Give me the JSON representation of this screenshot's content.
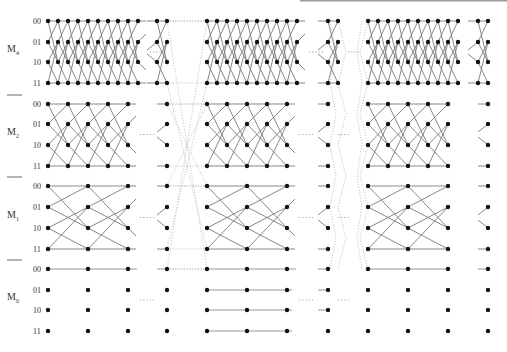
{
  "figure": {
    "type": "trellis-diagram",
    "modes": [
      {
        "name": "M",
        "sub": "4",
        "rows": [
          "00",
          "01",
          "10",
          "11"
        ],
        "y": [
          21,
          42,
          62,
          83
        ],
        "label_y": 52
      },
      {
        "name": "M",
        "sub": "2",
        "rows": [
          "00",
          "01",
          "10",
          "11"
        ],
        "y": [
          104,
          124,
          145,
          166
        ],
        "label_y": 135
      },
      {
        "name": "M",
        "sub": "1",
        "rows": [
          "00",
          "01",
          "10",
          "11"
        ],
        "y": [
          186,
          207,
          228,
          249
        ],
        "label_y": 218
      },
      {
        "name": "M",
        "sub": "0",
        "rows": [
          "00",
          "01",
          "10",
          "11"
        ],
        "y": [
          269,
          290,
          310,
          331
        ],
        "label_y": 300
      }
    ],
    "separators_y": [
      95,
      177,
      260
    ],
    "ellipsis": "···",
    "columns": {
      "M4": [
        [
          48,
          58,
          68,
          78,
          88,
          98,
          108,
          118,
          128,
          138
        ],
        [
          157,
          167
        ],
        [
          207,
          217,
          227,
          237,
          247,
          257,
          267,
          277,
          287,
          297
        ],
        [
          328,
          338
        ],
        [
          368,
          378,
          388,
          398,
          408,
          418,
          428,
          438,
          448,
          458
        ],
        [
          478,
          488
        ]
      ],
      "M2": [
        [
          48,
          68,
          88,
          108,
          128
        ],
        [
          167
        ],
        [
          207,
          227,
          247,
          267,
          287
        ],
        [
          328
        ],
        [
          368,
          388,
          408,
          428,
          448
        ],
        [
          488
        ]
      ],
      "M1": [
        [
          48,
          88,
          128
        ],
        [
          167
        ],
        [
          207,
          247,
          287
        ],
        [
          328
        ],
        [
          368,
          408,
          448
        ],
        [
          488
        ]
      ],
      "M0": [
        [
          48,
          88,
          128
        ],
        [
          167
        ],
        [
          207,
          247,
          287
        ],
        [
          328
        ],
        [
          368,
          408,
          448
        ],
        [
          488
        ]
      ]
    },
    "colors": {
      "node": "#111111",
      "edge": "#7a7a7a",
      "dotted": "#b8b8b8",
      "label": "#333333"
    }
  }
}
